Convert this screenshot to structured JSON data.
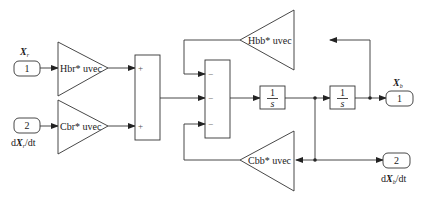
{
  "diagram": {
    "type": "simulink-block-diagram",
    "inports": [
      {
        "number": "1",
        "label_var": "X",
        "label_sub": "r",
        "label_pre": "",
        "label_post": ""
      },
      {
        "number": "2",
        "label_pre": "d",
        "label_var": "X",
        "label_sub": "r",
        "label_post": "/dt"
      }
    ],
    "outports": [
      {
        "number": "1",
        "label_var": "X",
        "label_sub": "b",
        "label_pre": "",
        "label_post": ""
      },
      {
        "number": "2",
        "label_pre": "d",
        "label_var": "X",
        "label_sub": "b",
        "label_post": "/dt"
      }
    ],
    "gains": {
      "hbr": "Hbr* uvec",
      "cbr": "Cbr* uvec",
      "hbb": "Hbb* uvec",
      "cbb": "Cbb* uvec"
    },
    "sum1": {
      "signs": [
        "+",
        "+"
      ]
    },
    "sum2": {
      "signs": [
        "−",
        "−",
        "−"
      ]
    },
    "integrators": [
      {
        "num": "1",
        "den": "s"
      },
      {
        "num": "1",
        "den": "s"
      }
    ]
  }
}
